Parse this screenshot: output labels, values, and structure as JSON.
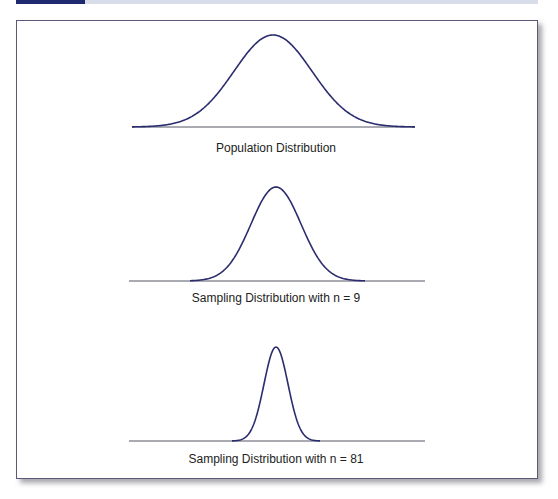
{
  "colors": {
    "curve": "#2b2d6e",
    "baseline": "#555566",
    "accent": "#1f2a6e",
    "band": "#d9dde9"
  },
  "panels": [
    {
      "label": "Population Distribution"
    },
    {
      "label": "Sampling Distribution with n = 9"
    },
    {
      "label": "Sampling Distribution with n = 81"
    }
  ],
  "chart_data": {
    "type": "line",
    "title": "",
    "series": [
      {
        "name": "Population Distribution",
        "n": 1,
        "relative_sd": 1.0,
        "center_x": 273,
        "peak_y": 35,
        "baseline_y": 127,
        "baseline_x": [
          132,
          415
        ],
        "sigma_px": 39
      },
      {
        "name": "Sampling Distribution with n = 9",
        "n": 9,
        "relative_sd": 0.333,
        "center_x": 276,
        "peak_y": 187,
        "baseline_y": 281,
        "baseline_x": [
          129,
          425
        ],
        "sigma_px": 25
      },
      {
        "name": "Sampling Distribution with n = 81",
        "n": 81,
        "relative_sd": 0.111,
        "center_x": 276,
        "peak_y": 347,
        "baseline_y": 441,
        "baseline_x": [
          129,
          425
        ],
        "sigma_px": 12
      }
    ],
    "label_positions": [
      {
        "x": 276,
        "y": 141
      },
      {
        "x": 276,
        "y": 291
      },
      {
        "x": 276,
        "y": 452
      }
    ],
    "curve_extent": [
      [
        132,
        415
      ],
      [
        190,
        365
      ],
      [
        232,
        320
      ]
    ]
  }
}
